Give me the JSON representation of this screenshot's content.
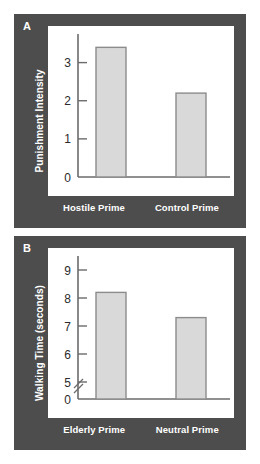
{
  "figure": {
    "background_color": "#ffffff",
    "panel_background_color": "#4d4d4d",
    "plot_background_color": "#ffffff",
    "bar_fill_color": "#d9d9d9",
    "bar_border_color": "#8c8c8c",
    "axis_color": "#6b6b6b",
    "label_color": "#ffffff"
  },
  "panels": [
    {
      "letter": "A",
      "ylabel": "Punishment Intensity",
      "xlabels": [
        "Hostile Prime",
        "Control Prime"
      ]
    },
    {
      "letter": "B",
      "ylabel": "Walking Time (seconds)",
      "xlabels": [
        "Elderly Prime",
        "Neutral Prime"
      ]
    }
  ],
  "chart_data": [
    {
      "type": "bar",
      "title": "",
      "panel": "A",
      "categories": [
        "Hostile Prime",
        "Control Prime"
      ],
      "values": [
        3.4,
        2.2
      ],
      "xlabel": "",
      "ylabel": "Punishment Intensity",
      "ylim": [
        0,
        3.75
      ],
      "yticks": [
        0,
        1,
        2,
        3
      ],
      "ytick_labels": [
        "0",
        "1",
        "2",
        "3"
      ],
      "grid": false,
      "legend": "none",
      "axis_break": false
    },
    {
      "type": "bar",
      "title": "",
      "panel": "B",
      "categories": [
        "Elderly Prime",
        "Neutral Prime"
      ],
      "values": [
        8.2,
        7.3
      ],
      "xlabel": "",
      "ylabel": "Walking Time (seconds)",
      "ylim": [
        0,
        9.5
      ],
      "yticks": [
        0,
        5,
        6,
        7,
        8,
        9
      ],
      "ytick_labels": [
        "0",
        "5",
        "6",
        "7",
        "8",
        "9"
      ],
      "grid": false,
      "legend": "none",
      "axis_break": true,
      "axis_break_note": "y-axis broken between 0 and 5"
    }
  ]
}
